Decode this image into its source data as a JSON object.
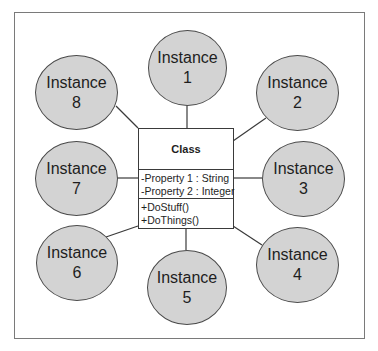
{
  "diagram": {
    "class": {
      "name": "Class",
      "attributes": [
        "-Property 1 : String",
        "-Property 2 : Integer"
      ],
      "methods": [
        "+DoStuff()",
        "+DoThings()"
      ]
    },
    "instances": [
      {
        "label": "Instance",
        "number": "1"
      },
      {
        "label": "Instance",
        "number": "2"
      },
      {
        "label": "Instance",
        "number": "3"
      },
      {
        "label": "Instance",
        "number": "4"
      },
      {
        "label": "Instance",
        "number": "5"
      },
      {
        "label": "Instance",
        "number": "6"
      },
      {
        "label": "Instance",
        "number": "7"
      },
      {
        "label": "Instance",
        "number": "8"
      }
    ],
    "colors": {
      "instance_fill": "#d3d3d3",
      "stroke": "#3a3a3a",
      "frame": "#7a7a7a"
    }
  }
}
